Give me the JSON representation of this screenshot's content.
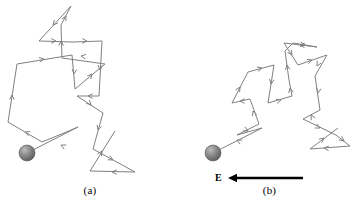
{
  "figure": {
    "background_color": "#ffffff",
    "trace_color": "#808080",
    "field_color": "#000000",
    "sphere_color": "#7a7a7a",
    "title": "",
    "panels": [
      {
        "id": "a",
        "caption": "(a)",
        "description": "random thermal motion of a conduction electron with no applied electric field",
        "sphere": {
          "cx": 27,
          "cy": 153,
          "r": 8
        },
        "path_points": [
          [
            27,
            153
          ],
          [
            78,
            127
          ],
          [
            64,
            133
          ],
          [
            42,
            142
          ],
          [
            8,
            122
          ],
          [
            17,
            64
          ],
          [
            72,
            55
          ],
          [
            75,
            89
          ],
          [
            105,
            64
          ],
          [
            62,
            58
          ],
          [
            61,
            25
          ],
          [
            71,
            6
          ],
          [
            39,
            41
          ],
          [
            73,
            42
          ],
          [
            102,
            41
          ],
          [
            99,
            96
          ],
          [
            77,
            96
          ],
          [
            103,
            113
          ],
          [
            93,
            149
          ],
          [
            135,
            172
          ],
          [
            90,
            171
          ],
          [
            115,
            131
          ]
        ],
        "arrow_marks": [
          {
            "x": 61,
            "y": 145,
            "angle": 207
          },
          {
            "x": 25,
            "y": 132,
            "angle": 201
          },
          {
            "x": 12,
            "y": 95,
            "angle": 272
          },
          {
            "x": 44,
            "y": 59,
            "angle": 351
          },
          {
            "x": 74,
            "y": 74,
            "angle": 95
          },
          {
            "x": 92,
            "y": 74,
            "angle": 310
          },
          {
            "x": 81,
            "y": 56,
            "angle": 188
          },
          {
            "x": 61,
            "y": 41,
            "angle": 269
          },
          {
            "x": 66,
            "y": 16,
            "angle": 298
          },
          {
            "x": 53,
            "y": 25,
            "angle": 132
          },
          {
            "x": 56,
            "y": 41,
            "angle": 1
          },
          {
            "x": 87,
            "y": 41,
            "angle": 1
          },
          {
            "x": 100,
            "y": 70,
            "angle": 95
          },
          {
            "x": 88,
            "y": 96,
            "angle": 181
          },
          {
            "x": 91,
            "y": 105,
            "angle": 46
          },
          {
            "x": 98,
            "y": 130,
            "angle": 107
          },
          {
            "x": 113,
            "y": 160,
            "angle": 29
          },
          {
            "x": 112,
            "y": 172,
            "angle": 180
          },
          {
            "x": 102,
            "y": 151,
            "angle": 302
          }
        ]
      },
      {
        "id": "b",
        "caption": "(b)",
        "description": "drift of a conduction electron superimposed on random motion with an applied electric field E directed to the left",
        "sphere": {
          "cx": 213,
          "cy": 153,
          "r": 8
        },
        "path_points": [
          [
            213,
            153
          ],
          [
            262,
            128
          ],
          [
            237,
            135
          ],
          [
            259,
            124
          ],
          [
            250,
            99
          ],
          [
            232,
            103
          ],
          [
            248,
            72
          ],
          [
            274,
            65
          ],
          [
            268,
            103
          ],
          [
            292,
            96
          ],
          [
            289,
            80
          ],
          [
            285,
            51
          ],
          [
            293,
            43
          ],
          [
            317,
            47
          ],
          [
            284,
            43
          ],
          [
            298,
            65
          ],
          [
            327,
            55
          ],
          [
            315,
            76
          ],
          [
            320,
            110
          ],
          [
            303,
            119
          ],
          [
            336,
            135
          ],
          [
            350,
            146
          ],
          [
            310,
            149
          ],
          [
            338,
            128
          ]
        ],
        "arrow_marks": [
          {
            "x": 237,
            "y": 140,
            "angle": 207
          },
          {
            "x": 248,
            "y": 131,
            "angle": 27
          },
          {
            "x": 253,
            "y": 111,
            "angle": 250
          },
          {
            "x": 240,
            "y": 101,
            "angle": 181
          },
          {
            "x": 240,
            "y": 87,
            "angle": 300
          },
          {
            "x": 262,
            "y": 68,
            "angle": 345
          },
          {
            "x": 271,
            "y": 84,
            "angle": 99
          },
          {
            "x": 281,
            "y": 100,
            "angle": 344
          },
          {
            "x": 290,
            "y": 88,
            "angle": 258
          },
          {
            "x": 287,
            "y": 65,
            "angle": 262
          },
          {
            "x": 305,
            "y": 45,
            "angle": 9
          },
          {
            "x": 300,
            "y": 45,
            "angle": 184
          },
          {
            "x": 292,
            "y": 55,
            "angle": 57
          },
          {
            "x": 312,
            "y": 60,
            "angle": 341
          },
          {
            "x": 317,
            "y": 66,
            "angle": 119
          },
          {
            "x": 318,
            "y": 93,
            "angle": 99
          },
          {
            "x": 311,
            "y": 115,
            "angle": 241
          },
          {
            "x": 320,
            "y": 128,
            "angle": 26
          },
          {
            "x": 344,
            "y": 141,
            "angle": 38
          },
          {
            "x": 324,
            "y": 148,
            "angle": 184
          },
          {
            "x": 324,
            "y": 138,
            "angle": 321
          }
        ],
        "field": {
          "label": "E",
          "direction": "left",
          "arrow_start_x": 303,
          "arrow_end_x": 228,
          "arrow_y": 178,
          "label_x": 215,
          "label_y": 172
        }
      }
    ]
  }
}
